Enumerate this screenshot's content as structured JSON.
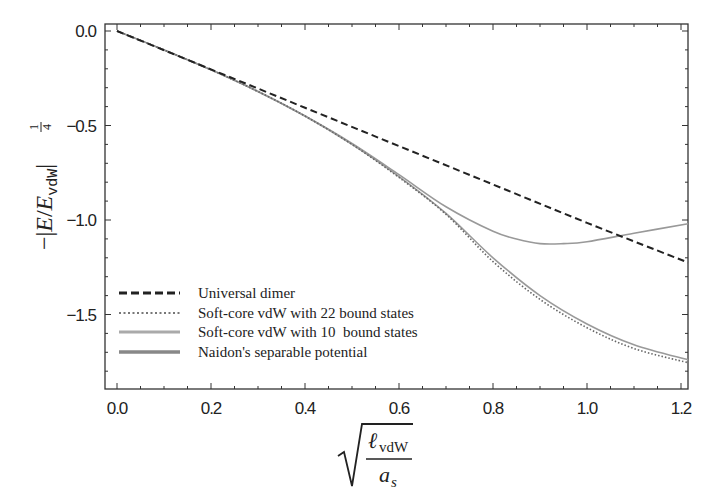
{
  "chart_data": {
    "type": "line",
    "title": "",
    "xlabel": "sqrt(l_vdW / a_s)",
    "ylabel": "-|E/E_vdW|^(1/4)",
    "xlim": [
      -0.025,
      1.215
    ],
    "ylim": [
      -1.89,
      0.04
    ],
    "x_ticks": [
      0.0,
      0.2,
      0.4,
      0.6,
      0.8,
      1.0,
      1.2
    ],
    "x_tick_labels": [
      "0.0",
      "0.2",
      "0.4",
      "0.6",
      "0.8",
      "1.0",
      "1.2"
    ],
    "y_ticks": [
      0.0,
      -0.5,
      -1.0,
      -1.5
    ],
    "y_tick_labels": [
      "0.0",
      "−0.5",
      "−1.0",
      "−1.5"
    ],
    "grid": false,
    "legend_position": "lower left",
    "series": [
      {
        "name": "Universal dimer",
        "style": "dashed",
        "color": "#222222",
        "x": [
          0.0,
          0.2,
          0.4,
          0.6,
          0.8,
          1.0,
          1.215
        ],
        "y": [
          0.0,
          -0.203,
          -0.406,
          -0.609,
          -0.812,
          -1.015,
          -1.225
        ]
      },
      {
        "name": "Soft-core vdW with 22 bound states",
        "style": "dotted",
        "color": "#777777",
        "x": [
          0.0,
          0.1,
          0.2,
          0.3,
          0.4,
          0.5,
          0.6,
          0.7,
          0.8,
          0.9,
          1.0,
          1.1,
          1.215
        ],
        "y": [
          0.0,
          -0.1,
          -0.205,
          -0.32,
          -0.45,
          -0.6,
          -0.775,
          -0.97,
          -1.22,
          -1.42,
          -1.57,
          -1.68,
          -1.755
        ]
      },
      {
        "name": "Soft-core vdW with 10 bound states",
        "style": "solid-light",
        "color": "#999999",
        "x": [
          0.0,
          0.1,
          0.2,
          0.3,
          0.4,
          0.5,
          0.6,
          0.7,
          0.8,
          0.85,
          0.9,
          0.95,
          1.0,
          1.1,
          1.215
        ],
        "y": [
          0.0,
          -0.1,
          -0.205,
          -0.32,
          -0.45,
          -0.595,
          -0.76,
          -0.93,
          -1.06,
          -1.1,
          -1.125,
          -1.125,
          -1.115,
          -1.07,
          -1.02
        ]
      },
      {
        "name": "Naidon's separable potential",
        "style": "solid",
        "color": "#888888",
        "x": [
          0.0,
          0.1,
          0.2,
          0.3,
          0.4,
          0.5,
          0.6,
          0.7,
          0.8,
          0.9,
          1.0,
          1.1,
          1.215
        ],
        "y": [
          0.0,
          -0.1,
          -0.205,
          -0.32,
          -0.45,
          -0.6,
          -0.77,
          -0.965,
          -1.2,
          -1.4,
          -1.55,
          -1.66,
          -1.74
        ]
      }
    ]
  },
  "axes": {
    "y_label_parts": {
      "minus": "−",
      "E": "E",
      "slash": "/",
      "Esub": "E",
      "sub": "vdW",
      "exp_num": "1",
      "exp_den": "4"
    },
    "x_label_parts": {
      "num": "ℓ",
      "num_sub": "vdW",
      "den": "a",
      "den_sub": "s"
    }
  },
  "legend": {
    "items": [
      {
        "label": "Universal dimer"
      },
      {
        "label": "Soft-core vdW with 22 bound states"
      },
      {
        "label": "Soft-core vdW with 10  bound states"
      },
      {
        "label": "Naidon's separable potential"
      }
    ]
  }
}
